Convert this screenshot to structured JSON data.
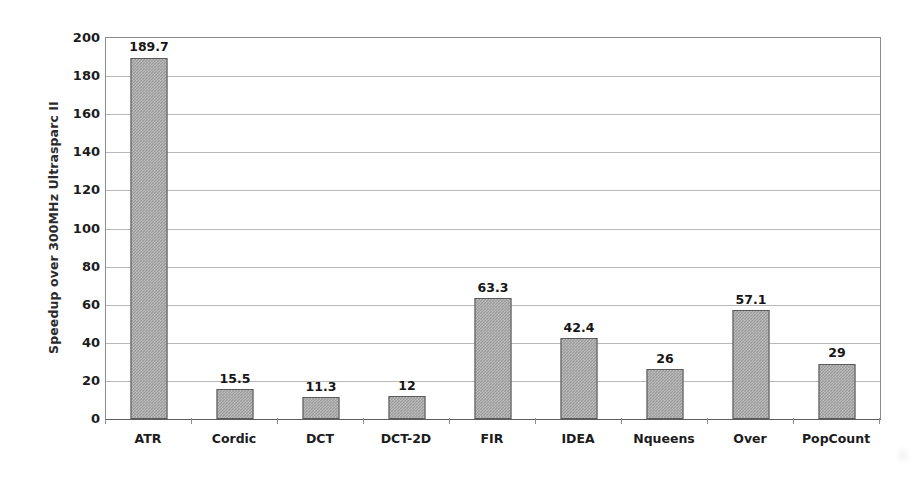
{
  "chart_data": {
    "type": "bar",
    "title": "",
    "subtitle": "",
    "xlabel": "",
    "ylabel": "Speedup over 300MHz Ultrasparc II",
    "categories": [
      "ATR",
      "Cordic",
      "DCT",
      "DCT-2D",
      "FIR",
      "IDEA",
      "Nqueens",
      "Over",
      "PopCount"
    ],
    "values": [
      189.7,
      15.5,
      11.3,
      12,
      63.3,
      42.4,
      26,
      57.1,
      29
    ],
    "value_labels": [
      "189.7",
      "15.5",
      "11.3",
      "12",
      "63.3",
      "42.4",
      "26",
      "57.1",
      "29"
    ],
    "ylim": [
      0,
      200
    ],
    "ytick_values": [
      0,
      20,
      40,
      60,
      80,
      100,
      120,
      140,
      160,
      180,
      200
    ],
    "ytick_labels": [
      "0",
      "20",
      "40",
      "60",
      "80",
      "100",
      "120",
      "140",
      "160",
      "180",
      "200"
    ],
    "grid": true,
    "grid_axis": "y",
    "legend": false,
    "legend_position": "none",
    "bar_fill_color": "#9b9b9b",
    "bar_edge_color": "#5a5a5a",
    "gridline_color": "#b9b9b9",
    "axis_color": "#8d8d8d",
    "text_color": "#1c1c1c",
    "background_color": "#ffffff"
  }
}
